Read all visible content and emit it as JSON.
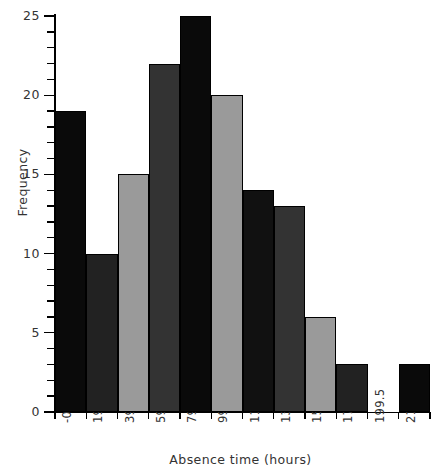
{
  "chart_data": {
    "type": "bar",
    "title": "",
    "subtitle": "",
    "xlabel": "Absence time (hours)",
    "ylabel": "Frequency",
    "grid": false,
    "legend": null,
    "bin_edges": [
      -0.5,
      19.5,
      39.5,
      59.5,
      79.5,
      99.5,
      119.5,
      139.5,
      159.5,
      179.5,
      199.5,
      219.5,
      239.5
    ],
    "categories": [
      "-0.5 to 19.5",
      "19.5 to 39.5",
      "39.5 to 59.5",
      "59.5 to 79.5",
      "79.5 to 99.5",
      "99.5 to 119.5",
      "119.5 to 139.5",
      "139.5 to 159.5",
      "159.5 to 179.5",
      "179.5 to 199.5",
      "199.5 to 219.5",
      "219.5 to 239.5"
    ],
    "values": [
      19,
      10,
      15,
      22,
      25,
      20,
      14,
      13,
      6,
      3,
      0,
      3
    ],
    "bar_colors": [
      "#0a0a0a",
      "#222222",
      "#9a9a9a",
      "#333333",
      "#0a0a0a",
      "#9a9a9a",
      "#111111",
      "#333333",
      "#9a9a9a",
      "#222222",
      "#ffffff",
      "#0a0a0a"
    ],
    "xlim": [
      -0.5,
      239.5
    ],
    "ylim": [
      0,
      25
    ],
    "ytick_labels": [
      "0",
      "5",
      "10",
      "15",
      "20",
      "25"
    ],
    "ytick_values": [
      0,
      5,
      10,
      15,
      20,
      25
    ],
    "yminor_values": [
      1,
      2,
      3,
      4,
      6,
      7,
      8,
      9,
      11,
      12,
      13,
      14,
      16,
      17,
      18,
      19,
      21,
      22,
      23,
      24
    ],
    "xtick_labels": [
      "-0.5",
      "19.5",
      "39.5",
      "59.5",
      "79.5",
      "99.5",
      "119.5",
      "139.5",
      "159.5",
      "179.5",
      "199.5",
      "219.5",
      "239.5"
    ],
    "axis_color": "#000000"
  }
}
